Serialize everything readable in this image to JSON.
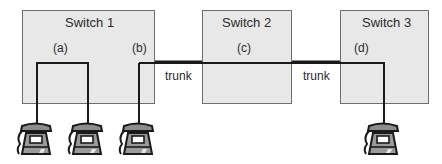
{
  "diagram": {
    "switches": [
      {
        "name": "Switch 1",
        "ports": [
          "(a)",
          "(b)"
        ]
      },
      {
        "name": "Switch 2",
        "ports": [
          "(c)"
        ]
      },
      {
        "name": "Switch 3",
        "ports": [
          "(d)"
        ]
      }
    ],
    "links": [
      {
        "label": "trunk",
        "from": "Switch 1 (b)",
        "to": "Switch 2 (c)"
      },
      {
        "label": "trunk",
        "from": "Switch 2 (c)",
        "to": "Switch 3 (d)"
      }
    ],
    "phones": [
      {
        "icon": "telephone-icon",
        "attached_to": "Switch 1 (a)"
      },
      {
        "icon": "telephone-icon",
        "attached_to": "Switch 1 (a)"
      },
      {
        "icon": "telephone-icon",
        "attached_to": "Switch 1 (b)"
      },
      {
        "icon": "telephone-icon",
        "attached_to": "Switch 3 (d)"
      }
    ],
    "colors": {
      "switch_fill": "#e8e8e8",
      "line": "#1a1a1a",
      "phone_fill": "#8c8c8c"
    }
  }
}
